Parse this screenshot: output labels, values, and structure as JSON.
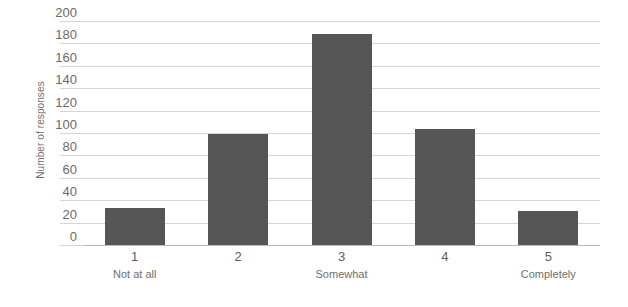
{
  "chart_data": {
    "type": "bar",
    "title": "",
    "subtitle": "",
    "xlabel": "",
    "ylabel": "Number of responses",
    "categories": [
      "1",
      "2",
      "3",
      "4",
      "5"
    ],
    "category_sublabels": [
      "Not at all",
      "",
      "Somewhat",
      "",
      "Completely"
    ],
    "values": [
      33,
      99,
      188,
      104,
      30
    ],
    "ylim": [
      0,
      200
    ],
    "ytick_labels": [
      "0",
      "20",
      "40",
      "60",
      "80",
      "100",
      "120",
      "140",
      "160",
      "180",
      "200"
    ],
    "ytick_values": [
      0,
      20,
      40,
      60,
      80,
      100,
      120,
      140,
      160,
      180,
      200
    ],
    "grid": true,
    "legend": "none",
    "bar_color": "#565656",
    "gridline_color": "#d6d6d6",
    "axis_color": "#b9b9b9",
    "tick_label_color": "#6b6b6b",
    "background_color": "#ffffff"
  }
}
